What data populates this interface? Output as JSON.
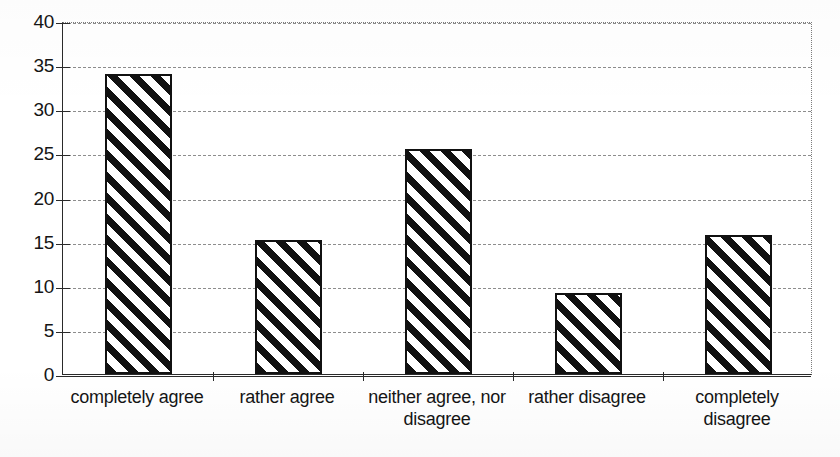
{
  "chart_data": {
    "type": "bar",
    "title": "",
    "subtitle": "",
    "xlabel": "",
    "ylabel": "",
    "categories": [
      "completely agree",
      "rather agree",
      "neither agree, nor disagree",
      "rather disagree",
      "completely disagree"
    ],
    "values": [
      34.0,
      15.2,
      25.5,
      9.2,
      15.7
    ],
    "ylim": [
      0,
      40
    ],
    "ytick_labels": [
      "0",
      "5",
      "10",
      "15",
      "20",
      "25",
      "30",
      "35",
      "40"
    ],
    "ytick_values": [
      0,
      5,
      10,
      15,
      20,
      25,
      30,
      35,
      40
    ],
    "grid": true,
    "gridline_style": "dashed",
    "legend": null,
    "legend_position": "none",
    "bar_fill": "diagonal-hatch",
    "bar_fill_color": "#111111",
    "bar_background_color": "#ffffff",
    "bar_border_color": "#111111",
    "axis_color": "#2a2a2a",
    "gridline_color": "#8d8d8d",
    "text_color": "#151515",
    "plot_background": "#ffffff"
  }
}
